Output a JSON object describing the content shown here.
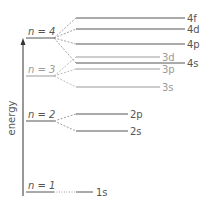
{
  "diagram": {
    "title": "",
    "axis_label": "energy",
    "colors": {
      "dark": "#555555",
      "light": "#9a9a9a",
      "axis": "#333333"
    },
    "shells": [
      {
        "id": "n1",
        "label": "n = 1",
        "sublevels": [
          "1s"
        ]
      },
      {
        "id": "n2",
        "label": "n = 2",
        "sublevels": [
          "2s",
          "2p"
        ]
      },
      {
        "id": "n3",
        "label": "n = 3",
        "sublevels": [
          "3s",
          "3p",
          "3d"
        ]
      },
      {
        "id": "n4",
        "label": "n = 4",
        "sublevels": [
          "4s",
          "4p",
          "4d",
          "4f"
        ]
      }
    ],
    "sublevels": [
      {
        "id": "1s",
        "label": "1s",
        "shell": "n1",
        "tone": "dark"
      },
      {
        "id": "2s",
        "label": "2s",
        "shell": "n2",
        "tone": "dark"
      },
      {
        "id": "2p",
        "label": "2p",
        "shell": "n2",
        "tone": "dark"
      },
      {
        "id": "3s",
        "label": "3s",
        "shell": "n3",
        "tone": "light"
      },
      {
        "id": "3p",
        "label": "3p",
        "shell": "n3",
        "tone": "light"
      },
      {
        "id": "3d",
        "label": "3d",
        "shell": "n3",
        "tone": "light"
      },
      {
        "id": "4s",
        "label": "4s",
        "shell": "n4",
        "tone": "dark"
      },
      {
        "id": "4p",
        "label": "4p",
        "shell": "n4",
        "tone": "dark"
      },
      {
        "id": "4d",
        "label": "4d",
        "shell": "n4",
        "tone": "dark"
      },
      {
        "id": "4f",
        "label": "4f",
        "shell": "n4",
        "tone": "dark"
      }
    ],
    "energy_order_low_to_high": [
      "1s",
      "2s",
      "2p",
      "3s",
      "3p",
      "4s",
      "3d",
      "4p",
      "4d",
      "4f"
    ]
  }
}
